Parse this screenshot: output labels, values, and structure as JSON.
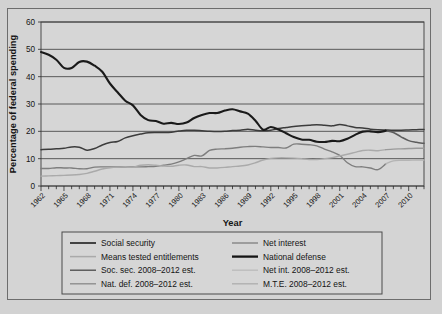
{
  "figure": {
    "background_color": "#d2d2d2",
    "plot_background_color": "#d6d6d6",
    "border_color": "#4a4a4a"
  },
  "chart_data": {
    "type": "line",
    "title": "",
    "xlabel": "Year",
    "ylabel": "Percentage of federal spending",
    "xlim": [
      1962,
      2012
    ],
    "ylim": [
      0,
      60
    ],
    "yticks": [
      0,
      10,
      20,
      30,
      40,
      50,
      60
    ],
    "ytick_labels": [
      "0",
      "10",
      "20",
      "30",
      "40",
      "50",
      "60"
    ],
    "xticks": [
      1962,
      1965,
      1968,
      1971,
      1974,
      1977,
      1980,
      1983,
      1986,
      1989,
      1992,
      1995,
      1998,
      2001,
      2004,
      2007,
      2010
    ],
    "xtick_labels": [
      "1962",
      "1965",
      "1968",
      "1971",
      "1974",
      "1977",
      "1980",
      "1983",
      "1986",
      "1989",
      "1992",
      "1995",
      "1998",
      "2001",
      "2004",
      "2007",
      "2010"
    ],
    "xtick_rotation": 45,
    "minor_xticks_every": 1,
    "grid": "horizontal",
    "legend_position": "below",
    "legend_columns": 2,
    "series": [
      {
        "name": "National defense",
        "color": "#1a1a1a",
        "width": 2.1,
        "x": [
          1962,
          1963,
          1964,
          1965,
          1966,
          1967,
          1968,
          1969,
          1970,
          1971,
          1972,
          1973,
          1974,
          1975,
          1976,
          1977,
          1978,
          1979,
          1980,
          1981,
          1982,
          1983,
          1984,
          1985,
          1986,
          1987,
          1988,
          1989,
          1990,
          1991,
          1992,
          1993,
          1994,
          1995,
          1996,
          1997,
          1998,
          1999,
          2000,
          2001,
          2002,
          2003,
          2004,
          2005,
          2006,
          2007
        ],
        "values": [
          49.0,
          48.0,
          46.2,
          43.2,
          43.2,
          45.4,
          45.5,
          44.0,
          41.8,
          37.5,
          34.3,
          31.2,
          29.5,
          26.0,
          24.1,
          23.8,
          22.8,
          23.1,
          22.7,
          23.2,
          24.9,
          26.0,
          26.7,
          26.7,
          27.6,
          28.1,
          27.3,
          26.5,
          23.9,
          20.6,
          21.6,
          20.7,
          19.3,
          17.9,
          17.0,
          16.9,
          16.2,
          16.1,
          16.5,
          16.4,
          17.3,
          18.7,
          19.9,
          20.0,
          19.7,
          20.2
        ],
        "scale_note": "percent of federal spending"
      },
      {
        "name": "Social security",
        "color": "#3c3c3c",
        "width": 1.5,
        "x": [
          1962,
          1963,
          1964,
          1965,
          1966,
          1967,
          1968,
          1969,
          1970,
          1971,
          1972,
          1973,
          1974,
          1975,
          1976,
          1977,
          1978,
          1979,
          1980,
          1981,
          1982,
          1983,
          1984,
          1985,
          1986,
          1987,
          1988,
          1989,
          1990,
          1991,
          1992,
          1993,
          1994,
          1995,
          1996,
          1997,
          1998,
          1999,
          2000,
          2001,
          2002,
          2003,
          2004,
          2005,
          2006,
          2007
        ],
        "values": [
          13.3,
          13.4,
          13.6,
          13.8,
          14.3,
          14.2,
          13.1,
          13.7,
          15.0,
          15.9,
          16.3,
          17.6,
          18.4,
          19.0,
          19.5,
          19.6,
          19.6,
          19.7,
          20.1,
          20.4,
          20.4,
          20.2,
          20.0,
          19.9,
          20.0,
          20.3,
          20.4,
          20.8,
          20.4,
          20.2,
          20.4,
          21.0,
          21.4,
          21.8,
          22.0,
          22.2,
          22.4,
          22.2,
          22.0,
          22.5,
          22.0,
          21.4,
          21.2,
          20.8,
          20.6,
          20.5
        ]
      },
      {
        "name": "Net interest",
        "color": "#7e7e7e",
        "width": 1.4,
        "x": [
          1962,
          1963,
          1964,
          1965,
          1966,
          1967,
          1968,
          1969,
          1970,
          1971,
          1972,
          1973,
          1974,
          1975,
          1976,
          1977,
          1978,
          1979,
          1980,
          1981,
          1982,
          1983,
          1984,
          1985,
          1986,
          1987,
          1988,
          1989,
          1990,
          1991,
          1992,
          1993,
          1994,
          1995,
          1996,
          1997,
          1998,
          1999,
          2000,
          2001,
          2002,
          2003,
          2004,
          2005,
          2006,
          2007
        ],
        "values": [
          6.4,
          6.4,
          6.7,
          6.6,
          6.6,
          6.3,
          6.3,
          6.9,
          7.0,
          7.0,
          7.0,
          6.9,
          7.0,
          7.0,
          7.1,
          7.2,
          7.6,
          8.0,
          8.8,
          10.0,
          11.2,
          11.0,
          13.0,
          13.5,
          13.6,
          13.8,
          14.2,
          14.4,
          14.5,
          14.3,
          14.1,
          14.1,
          13.9,
          15.3,
          15.3,
          15.1,
          14.7,
          13.5,
          12.5,
          11.2,
          8.5,
          7.1,
          7.0,
          6.6,
          6.0,
          8.1
        ]
      },
      {
        "name": "Means tested entitlements",
        "color": "#aaaaaa",
        "width": 1.4,
        "x": [
          1962,
          1963,
          1964,
          1965,
          1966,
          1967,
          1968,
          1969,
          1970,
          1971,
          1972,
          1973,
          1974,
          1975,
          1976,
          1977,
          1978,
          1979,
          1980,
          1981,
          1982,
          1983,
          1984,
          1985,
          1986,
          1987,
          1988,
          1989,
          1990,
          1991,
          1992,
          1993,
          1994,
          1995,
          1996,
          1997,
          1998,
          1999,
          2000,
          2001,
          2002,
          2003,
          2004,
          2005,
          2006,
          2007
        ],
        "values": [
          3.6,
          3.7,
          3.8,
          3.9,
          4.0,
          4.2,
          4.6,
          5.4,
          6.2,
          6.7,
          6.9,
          6.9,
          6.9,
          7.6,
          7.8,
          7.6,
          7.3,
          7.2,
          7.6,
          7.7,
          7.1,
          7.1,
          6.6,
          6.6,
          6.8,
          7.1,
          7.3,
          7.7,
          8.5,
          9.5,
          10.1,
          10.3,
          10.3,
          10.2,
          10.0,
          9.7,
          9.7,
          10.0,
          10.4,
          11.0,
          11.6,
          12.3,
          13.0,
          13.1,
          12.9,
          13.3
        ]
      },
      {
        "name": "Nat. def. 2008–2012 est.",
        "color": "#5d5d5d",
        "width": 1.5,
        "estimate": true,
        "x": [
          2007,
          2008,
          2009,
          2010,
          2011,
          2012
        ],
        "values": [
          20.2,
          19.6,
          18.0,
          16.6,
          16.0,
          15.6
        ]
      },
      {
        "name": "Soc. sec. 2008–2012 est.",
        "color": "#3c3c3c",
        "width": 1.5,
        "estimate": true,
        "x": [
          2007,
          2008,
          2009,
          2010,
          2011,
          2012
        ],
        "values": [
          20.5,
          20.4,
          20.4,
          20.5,
          20.6,
          20.7
        ]
      },
      {
        "name": "Net int. 2008–2012 est.",
        "color": "#b4b4b4",
        "width": 1.4,
        "estimate": true,
        "x": [
          2007,
          2008,
          2009,
          2010,
          2011,
          2012
        ],
        "values": [
          8.1,
          9.2,
          9.4,
          9.4,
          9.5,
          9.5
        ]
      },
      {
        "name": "M.T.E. 2008–2012 est.",
        "color": "#9a9a9a",
        "width": 1.4,
        "estimate": true,
        "x": [
          2007,
          2008,
          2009,
          2010,
          2011,
          2012
        ],
        "values": [
          13.3,
          13.5,
          13.6,
          13.7,
          13.8,
          13.8
        ]
      }
    ]
  },
  "legend": {
    "entries": [
      {
        "label": "Social security",
        "color": "#3c3c3c",
        "width": 1.9,
        "col": 0,
        "row": 0
      },
      {
        "label": "Means tested entitlements",
        "color": "#aaaaaa",
        "width": 1.5,
        "col": 0,
        "row": 1
      },
      {
        "label": "Soc. sec. 2008–2012 est.",
        "color": "#4a4a4a",
        "width": 1.3,
        "col": 0,
        "row": 2
      },
      {
        "label": "Nat. def. 2008–2012 est.",
        "color": "#8e8e8e",
        "width": 1.4,
        "col": 0,
        "row": 3
      },
      {
        "label": "Net interest",
        "color": "#8a8a8a",
        "width": 1.5,
        "col": 1,
        "row": 0
      },
      {
        "label": "National defense",
        "color": "#141414",
        "width": 2.3,
        "col": 1,
        "row": 1
      },
      {
        "label": "Net int. 2008–2012 est.",
        "color": "#bdbdbd",
        "width": 1.4,
        "col": 1,
        "row": 2
      },
      {
        "label": "M.T.E. 2008–2012 est.",
        "color": "#b0b0b0",
        "width": 1.4,
        "col": 1,
        "row": 3
      }
    ]
  }
}
